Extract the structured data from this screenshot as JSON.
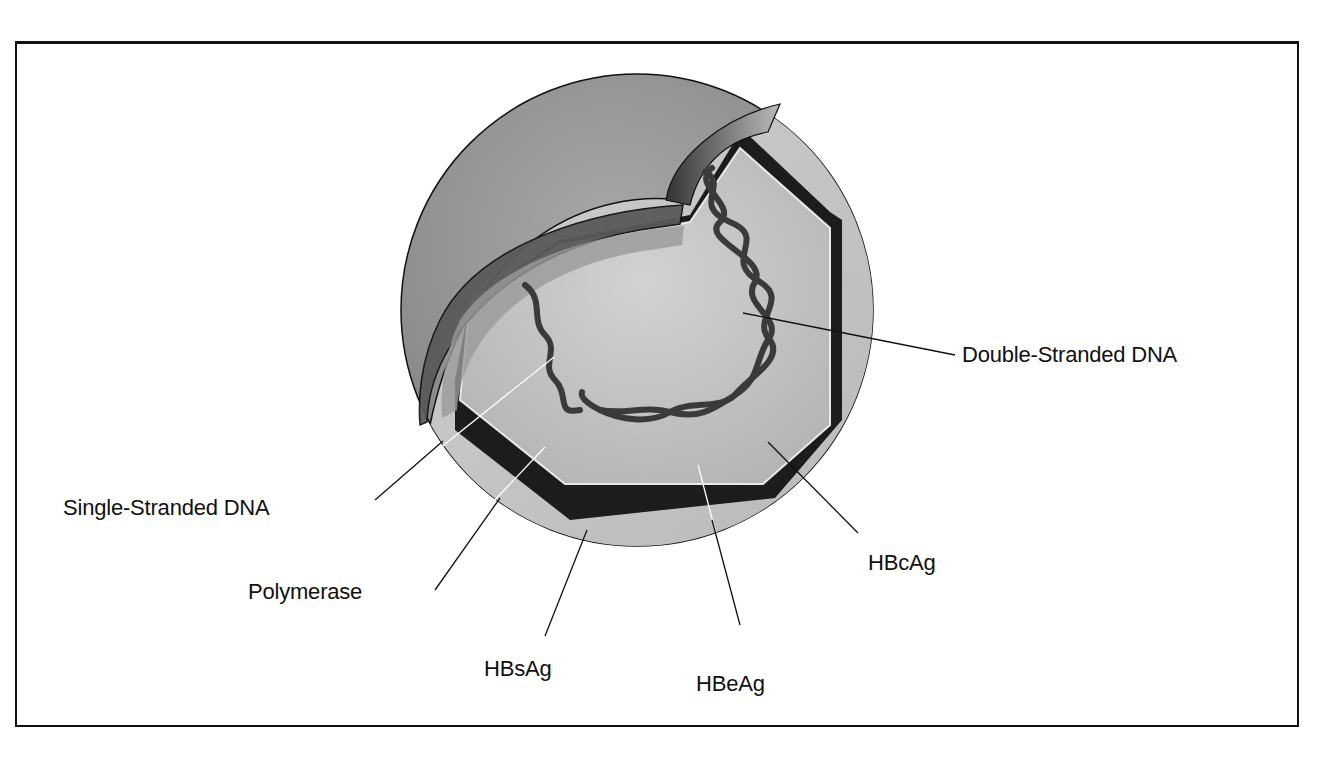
{
  "labels": {
    "double_stranded_dna": "Double-Stranded DNA",
    "single_stranded_dna": "Single-Stranded DNA",
    "polymerase": "Polymerase",
    "hbsag": "HBsAg",
    "hbeag": "HBeAg",
    "hbcag": "HBcAg"
  },
  "colors": {
    "outer_shell": "#8f8f8f",
    "envelope_band": "#c4c4c4",
    "capsid_dark": "#1c1c1c",
    "core": "#bdbdbd",
    "dna": "#3a3a3a",
    "frame": "#111111"
  }
}
